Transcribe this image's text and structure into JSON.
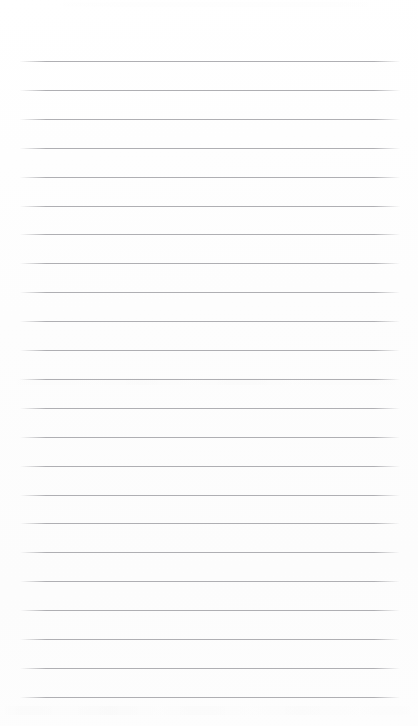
{
  "document": {
    "kind": "scanned-ruled-paper",
    "title": "Blank ruled notebook page",
    "content_text": "",
    "page_width": 418,
    "page_height": 726,
    "background_color": "#fdfdfd"
  },
  "ruling": {
    "line_color": "#a9a9ad",
    "line_thickness": 1,
    "line_count": 23,
    "left_x": 20,
    "right_x": 400,
    "first_line_y": 61,
    "line_spacing": 28.9,
    "margin_line_present": false,
    "lines_y": [
      61,
      89.9,
      118.8,
      147.7,
      176.6,
      205.5,
      234.4,
      263.3,
      292.2,
      321.1,
      350,
      378.9,
      407.8,
      436.7,
      465.6,
      494.5,
      523.4,
      552.3,
      581.2,
      610.1,
      639,
      667.9,
      696.8
    ]
  },
  "artifacts": {
    "scanner_bands": [
      {
        "name": "top-edge-band",
        "y": 2,
        "height": 5
      },
      {
        "name": "mid-page-band",
        "y": 378,
        "height": 7
      },
      {
        "name": "bottom-band",
        "y": 706,
        "height": 9
      }
    ]
  }
}
